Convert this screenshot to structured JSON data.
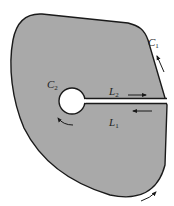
{
  "diagram": {
    "type": "contour-region-with-slit",
    "colors": {
      "region_fill": "#a9a9a9",
      "boundary": "#1a1a1a",
      "hole_fill": "#ffffff",
      "background": "#ffffff"
    },
    "labels": {
      "outer_contour": {
        "base": "C",
        "sub": "1"
      },
      "inner_contour": {
        "base": "C",
        "sub": "2"
      },
      "upper_cut": {
        "base": "L",
        "sub": "2"
      },
      "lower_cut": {
        "base": "L",
        "sub": "1"
      }
    },
    "arrows": [
      {
        "name": "outer-contour-arrow-right",
        "direction": "up-left",
        "on": "C1"
      },
      {
        "name": "outer-contour-arrow-bottom",
        "direction": "up-right",
        "on": "C1"
      },
      {
        "name": "inner-contour-arrow",
        "direction": "clockwise",
        "on": "C2"
      },
      {
        "name": "upper-cut-arrow",
        "direction": "right",
        "on": "L2"
      },
      {
        "name": "lower-cut-arrow",
        "direction": "left",
        "on": "L1"
      }
    ]
  }
}
